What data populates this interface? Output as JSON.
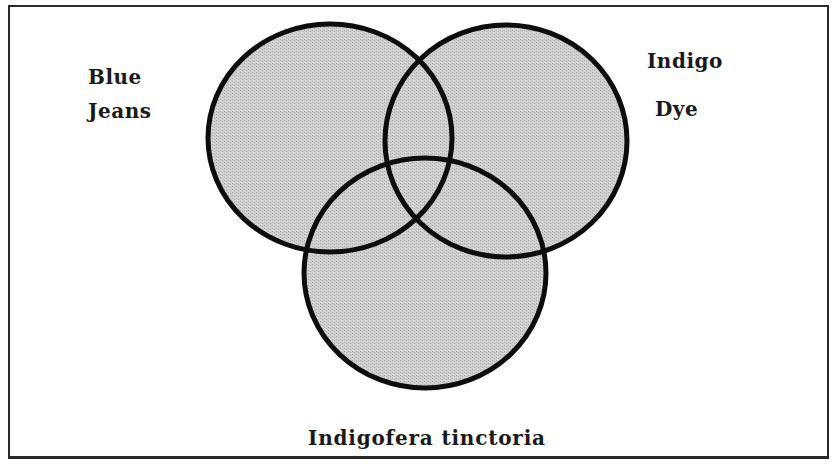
{
  "diagram": {
    "type": "venn",
    "sets": [
      {
        "id": "blue-jeans",
        "label_lines": [
          "Blue",
          "Jeans"
        ],
        "circle": {
          "cx": 330,
          "cy": 138,
          "rx": 122,
          "ry": 114
        }
      },
      {
        "id": "indigo-dye",
        "label_lines": [
          "Indigo",
          "Dye"
        ],
        "circle": {
          "cx": 506,
          "cy": 141,
          "rx": 121,
          "ry": 116
        }
      },
      {
        "id": "indigofera-tinctoria",
        "label_lines": [
          "Indigofera tinctoria"
        ],
        "circle": {
          "cx": 425,
          "cy": 273,
          "rx": 121,
          "ry": 115
        }
      }
    ],
    "style": {
      "fill": "#c8c8c8",
      "stroke": "#0d0d0d",
      "stroke_width": 5,
      "frame_color": "#2a2a2a",
      "background": "#ffffff"
    }
  },
  "labels": {
    "blue_jeans": {
      "line1": "Blue",
      "line2": "Jeans"
    },
    "indigo_dye": {
      "line1": "Indigo",
      "line2": "Dye"
    },
    "indigofera": "Indigofera tinctoria"
  }
}
